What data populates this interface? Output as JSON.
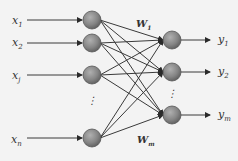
{
  "diagram": {
    "type": "neural-network",
    "background": "#f3f3f3",
    "node_fill": "#8a8a8a",
    "edge_color": "#3a3a3a",
    "inputs": [
      {
        "name": "x",
        "sub": "1",
        "y": 21
      },
      {
        "name": "x",
        "sub": "2",
        "y": 43
      },
      {
        "name": "x",
        "sub": "j",
        "y": 76
      },
      {
        "name": "x",
        "sub": "n",
        "y": 140
      }
    ],
    "hidden_nodes": [
      {
        "y": 20
      },
      {
        "y": 43
      },
      {
        "y": 75
      },
      {
        "y": 138
      }
    ],
    "hidden_ellipsis": "⋮",
    "outputs": [
      {
        "name": "y",
        "sub": "1",
        "y": 40
      },
      {
        "name": "y",
        "sub": "2",
        "y": 72
      },
      {
        "name": "y",
        "sub": "m",
        "y": 115
      }
    ],
    "output_ellipsis": "⋮",
    "weights": [
      {
        "name": "W",
        "sub": "1"
      },
      {
        "name": "W",
        "sub": "m"
      }
    ]
  }
}
